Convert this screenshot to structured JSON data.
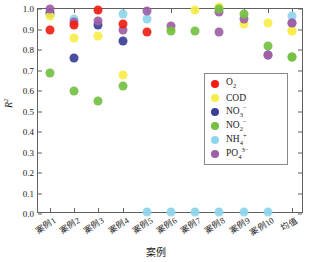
{
  "chart_data": {
    "type": "scatter",
    "title": "",
    "xlabel": "案例",
    "ylabel": "R²",
    "ylim": [
      0.0,
      1.0
    ],
    "yticks": [
      "0.0",
      "0.1",
      "0.2",
      "0.3",
      "0.4",
      "0.5",
      "0.6",
      "0.7",
      "0.8",
      "0.9",
      "1.0"
    ],
    "grid": false,
    "legend_position": "center-right",
    "categories": [
      "案例1",
      "案例2",
      "案例3",
      "案例4",
      "案例5",
      "案例6",
      "案例7",
      "案例8",
      "案例9",
      "案例10",
      "均值"
    ],
    "series": [
      {
        "name": "O₂",
        "name_plain": "O2",
        "color": "#f01e14",
        "values": [
          0.89,
          0.91,
          0.985,
          0.915,
          0.88,
          null,
          null,
          null,
          null,
          null,
          null
        ]
      },
      {
        "name": "COD",
        "name_plain": "COD",
        "color": "#f7ed4a",
        "values": [
          0.955,
          0.85,
          0.86,
          0.67,
          null,
          0.89,
          0.985,
          1.0,
          0.915,
          0.92,
          0.885
        ]
      },
      {
        "name": "NO₃⁻",
        "name_plain": "NO3-",
        "color": "#3b3f96",
        "values": [
          0.97,
          0.75,
          0.91,
          0.835,
          null,
          null,
          null,
          null,
          null,
          null,
          null
        ]
      },
      {
        "name": "NO₂⁻",
        "name_plain": "NO2-",
        "color": "#74c043",
        "values": [
          0.68,
          0.59,
          0.54,
          0.615,
          null,
          0.885,
          0.885,
          0.99,
          0.965,
          0.81,
          0.755
        ]
      },
      {
        "name": "NH₄⁺",
        "name_plain": "NH4+",
        "color": "#8fd6ec",
        "values": [
          0.96,
          0.94,
          null,
          0.965,
          0.94,
          0.0,
          0.0,
          0.0,
          0.0,
          0.0,
          0.955
        ]
      },
      {
        "name": "PO₄³⁻",
        "name_plain": "PO43-",
        "color": "#9d5fa5",
        "values": [
          0.99,
          0.925,
          0.93,
          0.89,
          0.98,
          0.905,
          null,
          0.978,
          0.94,
          0.765,
          0.92
        ]
      }
    ],
    "extra_points": [
      {
        "series": "PO₄³⁻",
        "category": "案例8",
        "value": 0.88
      },
      {
        "series": "NH₄⁺",
        "category": "案例5",
        "value": 0.0
      },
      {
        "series": "PO₄³⁻",
        "category": "案例10",
        "value": 0.765
      },
      {
        "series": "NO₂⁻",
        "category": "均值",
        "value": 0.755
      },
      {
        "series": "COD",
        "category": "均值",
        "value": 0.885
      },
      {
        "series": "PO₄³⁻",
        "category": "均值",
        "value": 0.92
      }
    ]
  },
  "legend": {
    "items": [
      {
        "label": "O",
        "sub": "2",
        "sup": "",
        "color": "#f01e14",
        "name": "legend-o2"
      },
      {
        "label": "COD",
        "sub": "",
        "sup": "",
        "color": "#f7ed4a",
        "name": "legend-cod"
      },
      {
        "label": "NO",
        "sub": "3",
        "sup": "−",
        "color": "#3b3f96",
        "name": "legend-no3"
      },
      {
        "label": "NO",
        "sub": "2",
        "sup": "−",
        "color": "#74c043",
        "name": "legend-no2"
      },
      {
        "label": "NH",
        "sub": "4",
        "sup": "+",
        "color": "#8fd6ec",
        "name": "legend-nh4"
      },
      {
        "label": "PO",
        "sub": "4",
        "sup": "3−",
        "color": "#9d5fa5",
        "name": "legend-po4"
      }
    ]
  },
  "axes": {
    "y_label_main": "R",
    "y_label_sup": "2",
    "x_label": "案例"
  }
}
